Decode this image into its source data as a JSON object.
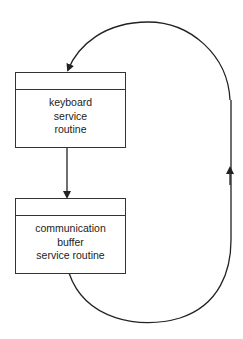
{
  "diagram": {
    "nodes": [
      {
        "id": "keyboard",
        "lines": [
          "keyboard",
          "service",
          "routine"
        ]
      },
      {
        "id": "comm",
        "lines": [
          "communication",
          "buffer",
          "service routine"
        ]
      }
    ],
    "edges": [
      {
        "from": "keyboard",
        "to": "comm",
        "type": "straight-arrow"
      },
      {
        "from": "comm",
        "to": "keyboard",
        "type": "loop-arrow-right-side"
      }
    ],
    "stroke_color": "#333333"
  }
}
